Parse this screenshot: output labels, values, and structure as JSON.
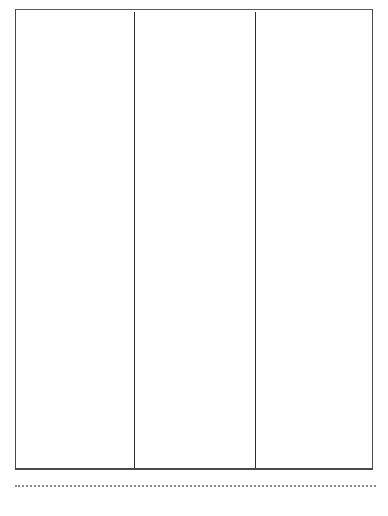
{
  "page": {
    "type": "blank three-column form",
    "columns": [
      {
        "label": ""
      },
      {
        "label": ""
      },
      {
        "label": ""
      }
    ],
    "footer_line": "dotted"
  }
}
